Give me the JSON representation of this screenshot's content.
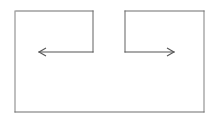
{
  "canvas": {
    "width": 213,
    "height": 120,
    "background": "#ffffff",
    "title": "Two-arrow rectangle line diagram"
  },
  "style": {
    "stroke_color": "#8a8a8a",
    "stroke_color_dark": "#6f6f6f",
    "arrow_color": "#555555",
    "stroke_width": 1.1
  },
  "shapes": {
    "outer_rectangle": {
      "name": "outer-rectangle",
      "left": 15,
      "top": 11,
      "right": 204,
      "bottom": 112,
      "top_edge_gap": {
        "from_x": 93,
        "to_x": 125,
        "note": "top edge is split into two segments"
      }
    },
    "left_subrectangle": {
      "name": "left-subrectangle",
      "left": 16,
      "top": 11,
      "right": 93,
      "bottom": 52
    },
    "right_subrectangle": {
      "name": "right-subrectangle",
      "left": 125,
      "top": 11,
      "right": 204,
      "bottom": 52
    }
  },
  "arrows": [
    {
      "name": "left-arrow",
      "direction": "left",
      "y": 52,
      "tail_x": 93,
      "tip_x": 39,
      "head_length": 7,
      "head_half_height": 4
    },
    {
      "name": "right-arrow",
      "direction": "right",
      "y": 52,
      "tail_x": 125,
      "tip_x": 174,
      "head_length": 7,
      "head_half_height": 4
    }
  ]
}
